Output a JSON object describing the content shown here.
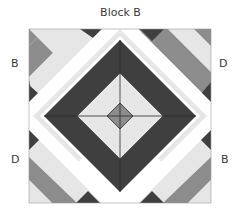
{
  "title": "Block B",
  "labels": {
    "top_left": "B",
    "top_right": "D",
    "bottom_left": "D",
    "bottom_right": "B"
  },
  "colors": {
    "dark": "#3f3f3f",
    "medium": "#8c8c8c",
    "light": "#e6e6e6",
    "white": "#ffffff",
    "line": "#2a2a2a"
  }
}
